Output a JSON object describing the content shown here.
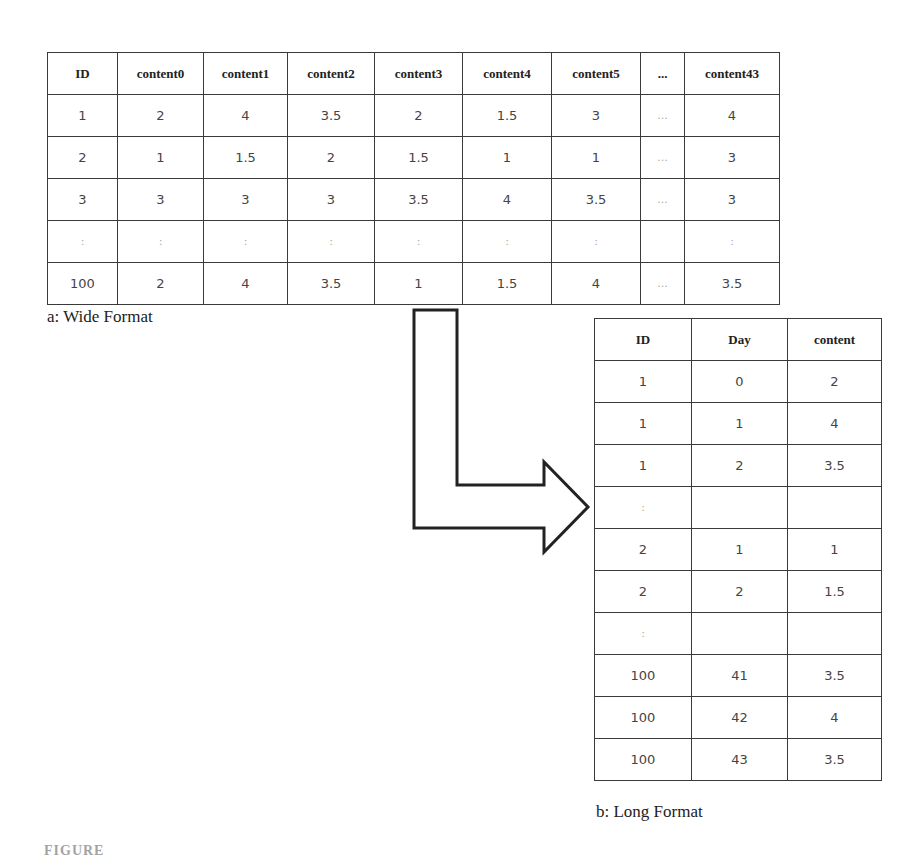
{
  "wide_table": {
    "caption": "a: Wide Format",
    "headers": [
      "ID",
      "content0",
      "content1",
      "content2",
      "content3",
      "content4",
      "content5",
      "...",
      "content43"
    ],
    "rows": [
      [
        "1",
        "2",
        "4",
        "3.5",
        "2",
        "1.5",
        "3",
        "...",
        "4"
      ],
      [
        "2",
        "1",
        "1.5",
        "2",
        "1.5",
        "1",
        "1",
        "...",
        "3"
      ],
      [
        "3",
        "3",
        "3",
        "3",
        "3.5",
        "4",
        "3.5",
        "...",
        "3"
      ],
      [
        ":",
        ":",
        ":",
        ":",
        ":",
        ":",
        ":",
        "",
        ":"
      ],
      [
        "100",
        "2",
        "4",
        "3.5",
        "1",
        "1.5",
        "4",
        "...",
        "3.5"
      ]
    ]
  },
  "long_table": {
    "caption": "b: Long Format",
    "headers": [
      "ID",
      "Day",
      "content"
    ],
    "rows": [
      [
        "1",
        "0",
        "2"
      ],
      [
        "1",
        "1",
        "4"
      ],
      [
        "1",
        "2",
        "3.5"
      ],
      [
        ":",
        "",
        ""
      ],
      [
        "2",
        "1",
        "1"
      ],
      [
        "2",
        "2",
        "1.5"
      ],
      [
        ":",
        "",
        ""
      ],
      [
        "100",
        "41",
        "3.5"
      ],
      [
        "100",
        "42",
        "4"
      ],
      [
        "100",
        "43",
        "3.5"
      ]
    ]
  },
  "arrow": {
    "icon": "bent-arrow-right-icon",
    "stroke": "#222222"
  },
  "figure_caption": "FIGURE"
}
